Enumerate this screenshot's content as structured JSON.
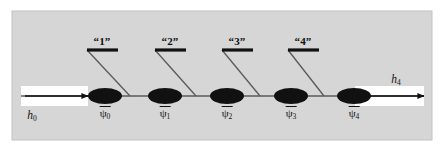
{
  "figure": {
    "name": "tensor-network-mps-diagram",
    "background_color": "#ffffff",
    "panel_color": "#d6d6d6",
    "panel_border_color": "#c2c2c2",
    "ink_color": "#111111",
    "wire_color": "#5a5a5a",
    "strip_color": "#ffffff",
    "panel": {
      "x": 12,
      "y": 11,
      "width": 420,
      "height": 129
    }
  },
  "axis": {
    "name": "horizontal-wire",
    "y": 96,
    "x_start": 21,
    "x_end": 424,
    "stroke_width": 1.6
  },
  "nodes": [
    {
      "id": "psi0",
      "label": "ψ",
      "subscript": "0",
      "cx": 105,
      "cy": 96,
      "rx": 17,
      "ry": 8,
      "label_x": 105,
      "label_y": 106
    },
    {
      "id": "psi1",
      "label": "ψ",
      "subscript": "1",
      "cx": 165,
      "cy": 96,
      "rx": 17,
      "ry": 8,
      "label_x": 165,
      "label_y": 106
    },
    {
      "id": "psi2",
      "label": "ψ",
      "subscript": "2",
      "cx": 227,
      "cy": 96,
      "rx": 17,
      "ry": 8,
      "label_x": 227,
      "label_y": 106
    },
    {
      "id": "psi3",
      "label": "ψ",
      "subscript": "3",
      "cx": 291,
      "cy": 96,
      "rx": 17,
      "ry": 8,
      "label_x": 291,
      "label_y": 106
    },
    {
      "id": "psi4",
      "label": "ψ",
      "subscript": "4",
      "cx": 354,
      "cy": 96,
      "rx": 17,
      "ry": 8,
      "label_x": 354,
      "label_y": 106
    }
  ],
  "gates": [
    {
      "id": "gate1",
      "label": "“1”",
      "bar_x1": 87,
      "bar_x2": 118,
      "bar_y": 50,
      "label_x": 102,
      "label_y": 36,
      "leg_x1": 87,
      "leg_y1": 50,
      "leg_x2": 130,
      "leg_y2": 96
    },
    {
      "id": "gate2",
      "label": "“2”",
      "bar_x1": 155,
      "bar_x2": 186,
      "bar_y": 50,
      "label_x": 170,
      "label_y": 36,
      "leg_x1": 155,
      "leg_y1": 50,
      "leg_x2": 196,
      "leg_y2": 96
    },
    {
      "id": "gate3",
      "label": "“3”",
      "bar_x1": 222,
      "bar_x2": 253,
      "bar_y": 50,
      "label_x": 237,
      "label_y": 36,
      "leg_x1": 222,
      "leg_y1": 50,
      "leg_x2": 260,
      "leg_y2": 96
    },
    {
      "id": "gate4",
      "label": "“4”",
      "bar_x1": 288,
      "bar_x2": 319,
      "bar_y": 50,
      "label_x": 303,
      "label_y": 36,
      "leg_x1": 288,
      "leg_y1": 50,
      "leg_x2": 324,
      "leg_y2": 96
    }
  ],
  "external_legs": [
    {
      "id": "h0",
      "label": "h",
      "subscript": "0",
      "side": "left",
      "strip": {
        "x": 21,
        "y": 86,
        "width": 67,
        "height": 20
      },
      "arrow": {
        "x1": 25,
        "y1": 96,
        "x2": 88,
        "y2": 96
      },
      "label_x": 32,
      "label_y": 110
    },
    {
      "id": "h4",
      "label": "h",
      "subscript": "4",
      "side": "right",
      "strip": {
        "x": 355,
        "y": 86,
        "width": 69,
        "height": 20
      },
      "arrow": {
        "x1": 358,
        "y1": 96,
        "x2": 424,
        "y2": 96
      },
      "label_x": 396,
      "label_y": 74
    }
  ]
}
